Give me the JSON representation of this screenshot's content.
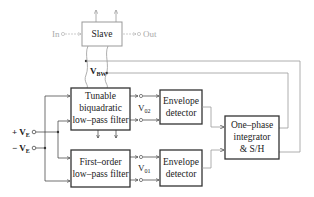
{
  "diagram": {
    "slave": {
      "label": "Slave",
      "input_label": "In",
      "output_label": "Out"
    },
    "tunable_filter": {
      "lines": [
        "Tunable",
        "biquadratic",
        "low–pass filter"
      ]
    },
    "first_order_filter": {
      "lines": [
        "First–order",
        "low–pass filter"
      ]
    },
    "envelope_detector_1": {
      "lines": [
        "Envelope",
        "detector"
      ]
    },
    "envelope_detector_2": {
      "lines": [
        "Envelope",
        "detector"
      ]
    },
    "integrator": {
      "lines": [
        "One–phase",
        "integrator",
        "& S/H"
      ]
    },
    "signals": {
      "vbw": {
        "main": "V",
        "sub": "BW"
      },
      "v02": {
        "main": "V",
        "sub": "02"
      },
      "v01": {
        "main": "V",
        "sub": "01"
      },
      "vep": {
        "sign": "+",
        "main": "V",
        "sub": "E"
      },
      "ven": {
        "sign": "−",
        "main": "V",
        "sub": "E"
      }
    },
    "colors": {
      "line": "#333333",
      "gray_line": "#999999",
      "faded_text": "#aaaaaa"
    }
  }
}
